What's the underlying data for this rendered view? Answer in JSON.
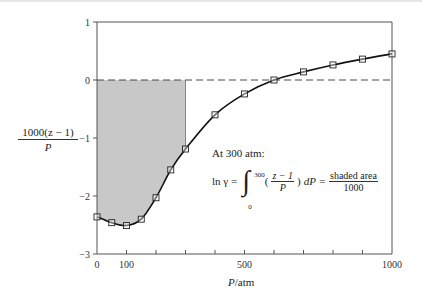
{
  "chart_data": {
    "type": "line",
    "title": "",
    "xlabel": "P/atm",
    "ylabel": "1000(z − 1) / P",
    "xlim": [
      0,
      1000
    ],
    "ylim": [
      -3,
      1
    ],
    "x_ticks": [
      0,
      100,
      200,
      300,
      400,
      500,
      600,
      700,
      800,
      900,
      1000
    ],
    "x_tick_labels": [
      "0",
      "100",
      "",
      "",
      "",
      "500",
      "",
      "",
      "",
      "",
      "1000"
    ],
    "y_ticks": [
      1,
      0,
      -1,
      -2,
      -3
    ],
    "y_tick_labels": [
      "1",
      "0",
      "−1",
      "−2",
      "−3"
    ],
    "grid": false,
    "reference_line": {
      "y": 0,
      "style": "dashed"
    },
    "shaded_region": {
      "x_from": 0,
      "x_to": 300,
      "y_from": 0,
      "fill": "#c8c8c8",
      "description": "area between curve and y=0 from P=0 to 300"
    },
    "series": [
      {
        "name": "1000(z-1)/P",
        "marker": "square",
        "x": [
          0,
          50,
          100,
          150,
          200,
          250,
          300,
          400,
          500,
          600,
          700,
          800,
          900,
          1000
        ],
        "values": [
          -2.36,
          -2.46,
          -2.51,
          -2.4,
          -2.03,
          -1.55,
          -1.19,
          -0.6,
          -0.24,
          0.0,
          0.14,
          0.26,
          0.36,
          0.45
        ]
      }
    ],
    "annotations": [
      "At 300 atm:",
      "ln γ = ∫₀³⁰⁰ ((z − 1)/P) dP = shaded area / 1000"
    ]
  },
  "labels": {
    "ylabel_num": "1000(z − 1)",
    "ylabel_den": "P",
    "xlabel_var": "P",
    "xlabel_unit": "/atm",
    "annot_line1": "At 300 atm:",
    "annot_lhs": "ln γ =",
    "annot_upper": "300",
    "annot_lower": "0",
    "annot_frac_num": "z − 1",
    "annot_frac_den": "P",
    "annot_dp": "dP =",
    "annot_rhs_num": "shaded area",
    "annot_rhs_den": "1000"
  },
  "colors": {
    "axis": "#555555",
    "curve": "#111111",
    "shade": "#c8c8c8",
    "dashed": "#333333"
  }
}
